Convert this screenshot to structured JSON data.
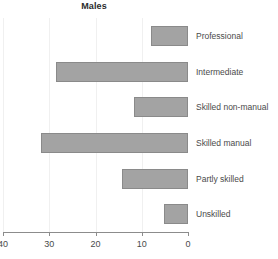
{
  "chart_data": {
    "type": "bar",
    "orientation": "horizontal",
    "title": "Males",
    "xlabel": "",
    "ylabel": "",
    "categories": [
      "Professional",
      "Intermediate",
      "Skilled non-manual",
      "Skilled manual",
      "Partly skilled",
      "Unskilled"
    ],
    "values": [
      8.0,
      28.5,
      11.7,
      31.7,
      14.3,
      5.2
    ],
    "xlim": [
      40,
      0
    ],
    "x_axis_reversed": true,
    "xticks": [
      40,
      30,
      20,
      10,
      0
    ],
    "xtick_labels": [
      "40",
      "30",
      "20",
      "10",
      "0"
    ],
    "grid": true,
    "legend": false,
    "bar_color": "#a3a3a3",
    "bar_edge_color": "#8a8a8a",
    "gridline_color": "#f0f0f0",
    "axis_color": "#8c8c8c",
    "category_label_position": "right",
    "baseline_value": 0,
    "baseline_side": "right"
  }
}
